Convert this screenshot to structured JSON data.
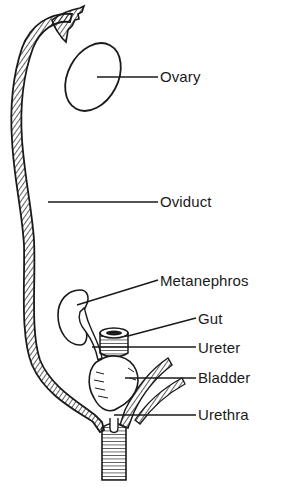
{
  "figure": {
    "type": "anatomical diagram",
    "line_color": "#1a1a1a",
    "background": "#ffffff"
  },
  "labels": [
    {
      "id": "ovary",
      "text": "Ovary",
      "x": 162,
      "y": 68
    },
    {
      "id": "oviduct",
      "text": "Oviduct",
      "x": 162,
      "y": 195
    },
    {
      "id": "metanephros",
      "text": "Metanephros",
      "x": 162,
      "y": 273
    },
    {
      "id": "gut",
      "text": "Gut",
      "x": 200,
      "y": 311
    },
    {
      "id": "ureter",
      "text": "Ureter",
      "x": 200,
      "y": 340
    },
    {
      "id": "bladder",
      "text": "Bladder",
      "x": 200,
      "y": 369
    },
    {
      "id": "urethra",
      "text": "Urethra",
      "x": 200,
      "y": 407
    }
  ]
}
